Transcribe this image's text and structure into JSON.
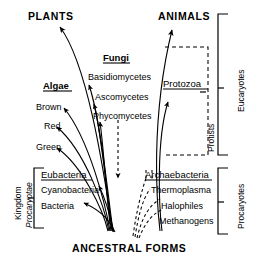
{
  "diagram": {
    "title_nodes": {
      "plants": "PLANTS",
      "animals": "ANIMALS",
      "ancestral": "ANCESTRAL FORMS"
    },
    "groups": {
      "algae": "Algae",
      "fungi": "Fungi",
      "eubacteria": "Eubacteria",
      "archaebacteria": "Archaebacteria",
      "protozoa": "Protozoa"
    },
    "algae_members": [
      "Brown",
      "Red",
      "Green"
    ],
    "fungi_members": [
      "Basidiomycetes",
      "Ascomycetes",
      "Phycomycetes"
    ],
    "eubacteria_members": [
      "Cyanobacteria",
      "Bacteria"
    ],
    "archaebacteria_members": [
      "Thermoplasma",
      "Halophiles",
      "Methanogens"
    ],
    "brackets": {
      "eucaryotes": "Eucaryotes",
      "procaryotes": "Procaryotes",
      "protists": "Protists",
      "kingdom_line1": "Kingdom",
      "kingdom_line2": "Procaryotae"
    },
    "colors": {
      "ink": "#000000",
      "background": "#ffffff"
    }
  }
}
